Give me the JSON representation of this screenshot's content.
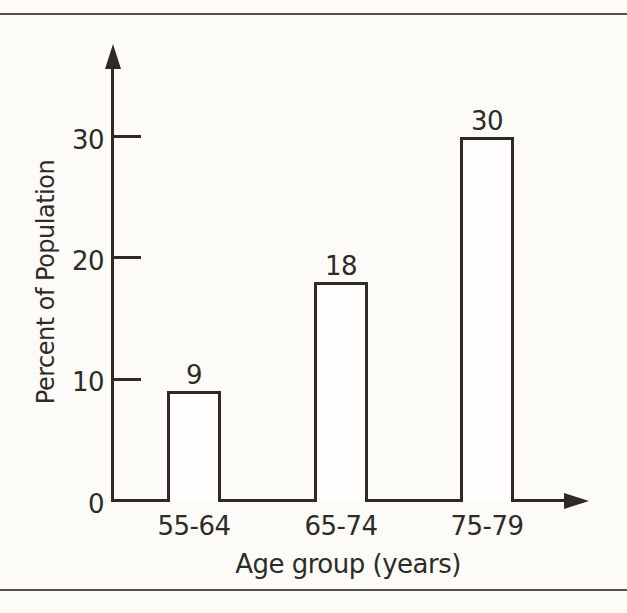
{
  "figure": {
    "background": "#fcfbf8",
    "ink_color": "#2e2b27",
    "rule_color": "#55524c",
    "bar_fill": "#fffefc"
  },
  "chart_data": {
    "type": "bar",
    "categories": [
      "55-64",
      "65-74",
      "75-79"
    ],
    "values": [
      9,
      18,
      30
    ],
    "title": "",
    "xlabel": "Age group (years)",
    "ylabel": "Percent of Population",
    "yticks": [
      0,
      10,
      20,
      30
    ],
    "ylim": [
      0,
      36
    ],
    "grid": false,
    "legend": null,
    "bar_outline_only": true,
    "value_labels_shown": true
  }
}
